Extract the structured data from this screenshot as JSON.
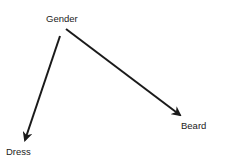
{
  "diagram": {
    "type": "causal-graph",
    "nodes": [
      {
        "id": "gender",
        "label": "Gender"
      },
      {
        "id": "dress",
        "label": "Dress"
      },
      {
        "id": "beard",
        "label": "Beard"
      }
    ],
    "edges": [
      {
        "from": "Gender",
        "to": "Dress"
      },
      {
        "from": "Gender",
        "to": "Beard"
      }
    ],
    "colors": {
      "arrow": "#1a1a1a",
      "text": "#222222",
      "background": "#ffffff"
    }
  }
}
